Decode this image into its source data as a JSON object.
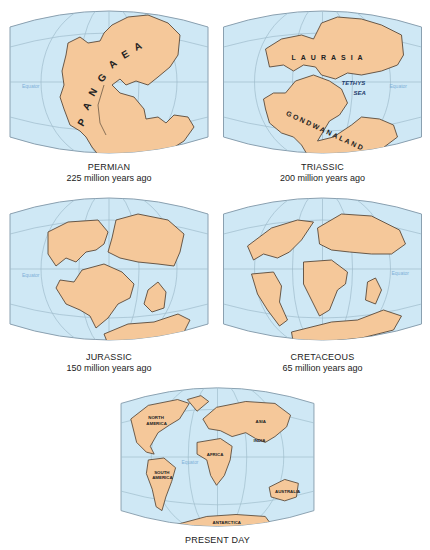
{
  "figure": {
    "colors": {
      "ocean": "#cfe8f5",
      "ocean_outline": "#8aa0b0",
      "grid": "#9fbccc",
      "land": "#f5c89a",
      "coast": "#5a4a3a",
      "equator_label": "#7fb0d8",
      "text": "#222222"
    },
    "panels": [
      {
        "id": "permian",
        "era": "PERMIAN",
        "age": "225 million years ago",
        "labels": {
          "supercontinent": "PANGAEA",
          "equator": "Equator"
        }
      },
      {
        "id": "triassic",
        "era": "TRIASSIC",
        "age": "200 million years ago",
        "labels": {
          "north": "LAURASIA",
          "south": "GONDWANALAND",
          "sea_line1": "TETHYS",
          "sea_line2": "SEA",
          "equator": "Equator"
        }
      },
      {
        "id": "jurassic",
        "era": "JURASSIC",
        "age": "150 million years ago",
        "labels": {
          "equator": "Equator"
        }
      },
      {
        "id": "cretaceous",
        "era": "CRETACEOUS",
        "age": "65 million years ago",
        "labels": {
          "equator": "Equator"
        }
      },
      {
        "id": "present",
        "era": "PRESENT DAY",
        "age": "",
        "labels": {
          "north_america_1": "NORTH",
          "north_america_2": "AMERICA",
          "south_america_1": "SOUTH",
          "south_america_2": "AMERICA",
          "africa": "AFRICA",
          "asia": "ASIA",
          "india": "INDIA",
          "australia": "AUSTRALIA",
          "antarctica": "ANTARCTICA",
          "equator": "Equator"
        }
      }
    ]
  }
}
